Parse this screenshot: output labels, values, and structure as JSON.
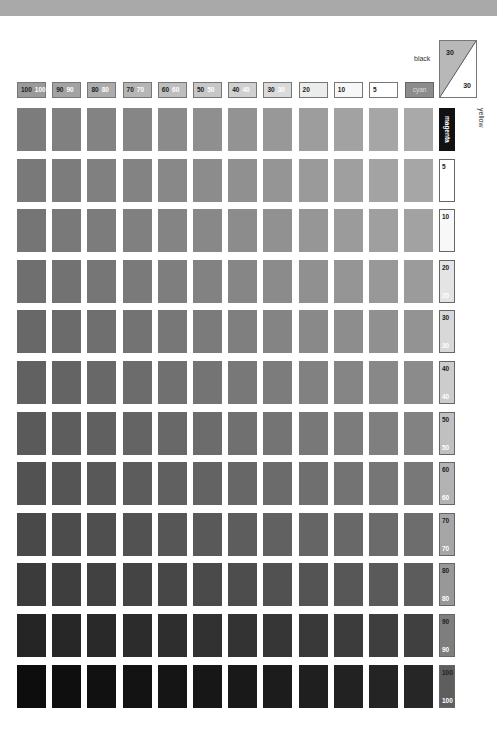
{
  "legend": {
    "black_label": "black",
    "yellow_label": "yellow",
    "cyan_label": "cyan",
    "magenta_label": "magenta",
    "corner_black_value": "30",
    "corner_yellow_value": "30"
  },
  "column_headers": [
    {
      "black": "100",
      "white": "100",
      "bg": "#9a9a9a"
    },
    {
      "black": "90",
      "white": "90",
      "bg": "#a3a3a3"
    },
    {
      "black": "80",
      "white": "80",
      "bg": "#acacac"
    },
    {
      "black": "70",
      "white": "70",
      "bg": "#b5b5b5"
    },
    {
      "black": "60",
      "white": "60",
      "bg": "#bebebe"
    },
    {
      "black": "50",
      "white": "50",
      "bg": "#c7c7c7"
    },
    {
      "black": "40",
      "white": "40",
      "bg": "#d0d0d0"
    },
    {
      "black": "30",
      "white": "30",
      "bg": "#dadada"
    },
    {
      "black": "20",
      "white": "",
      "bg": "#ececec"
    },
    {
      "black": "10",
      "white": "",
      "bg": "#f7f7f7"
    },
    {
      "black": "5",
      "white": "",
      "bg": "#ffffff"
    }
  ],
  "row_labels": [
    {
      "top": "5",
      "bottom": "",
      "bg": "#ffffff"
    },
    {
      "top": "10",
      "bottom": "",
      "bg": "#f8f8f8"
    },
    {
      "top": "20",
      "bottom": "20",
      "bg": "#e4e4e4"
    },
    {
      "top": "30",
      "bottom": "30",
      "bg": "#d8d8d8"
    },
    {
      "top": "40",
      "bottom": "40",
      "bg": "#cccccc"
    },
    {
      "top": "50",
      "bottom": "50",
      "bg": "#c0c0c0"
    },
    {
      "top": "60",
      "bottom": "60",
      "bg": "#b3b3b3"
    },
    {
      "top": "70",
      "bottom": "70",
      "bg": "#a6a6a6"
    },
    {
      "top": "80",
      "bottom": "80",
      "bg": "#989898"
    },
    {
      "top": "90",
      "bottom": "90",
      "bg": "#7e7e7e"
    },
    {
      "top": "100",
      "bottom": "100",
      "bg": "#5e5e5e"
    }
  ],
  "chart_data": {
    "type": "heatmap",
    "x_axis_label": "cyan %",
    "y_axis_label": "magenta/yellow %",
    "x_categories": [
      "100",
      "90",
      "80",
      "70",
      "60",
      "50",
      "40",
      "30",
      "20",
      "10",
      "5",
      "0"
    ],
    "y_categories": [
      "0",
      "5",
      "10",
      "20",
      "30",
      "40",
      "50",
      "60",
      "70",
      "80",
      "90",
      "100"
    ],
    "fixed_black": 30,
    "fixed_yellow": 30,
    "grid_colors": [
      [
        "#7c7c7c",
        "#808080",
        "#838383",
        "#868686",
        "#8b8b8b",
        "#8f8f8f",
        "#939393",
        "#989898",
        "#9d9d9d",
        "#a2a2a2",
        "#a6a6a6",
        "#a9a9a9"
      ],
      [
        "#797979",
        "#7c7c7c",
        "#808080",
        "#838383",
        "#888888",
        "#8c8c8c",
        "#909090",
        "#959595",
        "#9a9a9a",
        "#9f9f9f",
        "#a3a3a3",
        "#a6a6a6"
      ],
      [
        "#757575",
        "#797979",
        "#7c7c7c",
        "#808080",
        "#848484",
        "#888888",
        "#8c8c8c",
        "#919191",
        "#969696",
        "#9b9b9b",
        "#9f9f9f",
        "#a2a2a2"
      ],
      [
        "#6f6f6f",
        "#727272",
        "#767676",
        "#7a7a7a",
        "#7e7e7e",
        "#828282",
        "#868686",
        "#8b8b8b",
        "#909090",
        "#959595",
        "#989898",
        "#9b9b9b"
      ],
      [
        "#686868",
        "#6b6b6b",
        "#6f6f6f",
        "#737373",
        "#777777",
        "#7b7b7b",
        "#7f7f7f",
        "#848484",
        "#898989",
        "#8d8d8d",
        "#909090",
        "#939393"
      ],
      [
        "#616161",
        "#646464",
        "#686868",
        "#6c6c6c",
        "#707070",
        "#747474",
        "#787878",
        "#7c7c7c",
        "#818181",
        "#858585",
        "#888888",
        "#8b8b8b"
      ],
      [
        "#5a5a5a",
        "#5d5d5d",
        "#606060",
        "#646464",
        "#686868",
        "#6c6c6c",
        "#707070",
        "#747474",
        "#787878",
        "#7c7c7c",
        "#7f7f7f",
        "#828282"
      ],
      [
        "#525252",
        "#555555",
        "#585858",
        "#5c5c5c",
        "#606060",
        "#636363",
        "#676767",
        "#6b6b6b",
        "#6f6f6f",
        "#737373",
        "#767676",
        "#787878"
      ],
      [
        "#494949",
        "#4c4c4c",
        "#4f4f4f",
        "#525252",
        "#565656",
        "#595959",
        "#5d5d5d",
        "#616161",
        "#656565",
        "#686868",
        "#6b6b6b",
        "#6d6d6d"
      ],
      [
        "#3b3b3b",
        "#3e3e3e",
        "#414141",
        "#444444",
        "#474747",
        "#4a4a4a",
        "#4d4d4d",
        "#515151",
        "#545454",
        "#575757",
        "#5a5a5a",
        "#5c5c5c"
      ],
      [
        "#252525",
        "#272727",
        "#292929",
        "#2c2c2c",
        "#2e2e2e",
        "#313131",
        "#333333",
        "#363636",
        "#393939",
        "#3c3c3c",
        "#3e3e3e",
        "#404040"
      ],
      [
        "#0d0d0d",
        "#0f0f0f",
        "#111111",
        "#131313",
        "#151515",
        "#171717",
        "#191919",
        "#1c1c1c",
        "#1f1f1f",
        "#222222",
        "#242424",
        "#262626"
      ]
    ]
  }
}
